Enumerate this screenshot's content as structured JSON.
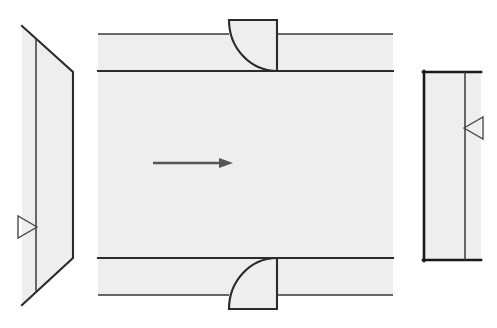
{
  "drawing": {
    "title": "Orthographic Views — Channel Bracket",
    "background_color": "#ffffff",
    "face_fill_color": "#eeeeee",
    "outline_color": "#1a1a1a",
    "arrow_color": "#555555",
    "marker_color": "#4a4a4a",
    "canvas": {
      "width": 497,
      "height": 328
    }
  },
  "views": {
    "left": {
      "name": "left-side-view",
      "label": "Left Side View",
      "shape": "trapezoid",
      "vertical_edge_x": 36,
      "outline_points": "22,26 73,72 73,258 22,305 22,26",
      "slant_top": "22,26 73,72",
      "slant_bottom": "73,258 22,305",
      "inner_edge": "36,40 36,292"
    },
    "center": {
      "name": "front-section-view",
      "label": "Front Section View",
      "body_left_x": 98,
      "body_right_x": 393,
      "body_top_y": 71,
      "body_bottom_y": 258,
      "upper_flange_top_y": 34,
      "lower_flange_bottom_y": 295,
      "flange_left_x": 98,
      "notch_top": {
        "name": "top-fillet-notch",
        "x": 229,
        "y": 20,
        "width": 48,
        "height": 51,
        "fillet_radius": 48
      },
      "notch_bottom": {
        "name": "bottom-fillet-notch",
        "x": 229,
        "y": 258,
        "width": 48,
        "height": 51,
        "fillet_radius": 48
      }
    },
    "right": {
      "name": "right-side-view",
      "label": "Right Side View",
      "shape": "rectangle",
      "outer_left_x": 424,
      "outer_right_x": 481,
      "top_y": 72,
      "bottom_y": 260,
      "inner_divider_x": 465
    }
  },
  "annotations": {
    "flow_arrow": {
      "name": "section-direction-arrow",
      "label": "Section Direction",
      "x_start": 153,
      "x_end": 233,
      "y": 163,
      "head_length": 14,
      "head_half_width": 5
    },
    "view_marker_left": {
      "name": "view-direction-marker-left",
      "label": "View Marker Left",
      "direction": "right",
      "tip_x": 37,
      "tip_y": 227,
      "back_x": 18,
      "half_height": 11
    },
    "view_marker_right": {
      "name": "view-direction-marker-right",
      "label": "View Marker Right",
      "direction": "left",
      "tip_x": 464,
      "tip_y": 128,
      "back_x": 483,
      "half_height": 11
    }
  }
}
